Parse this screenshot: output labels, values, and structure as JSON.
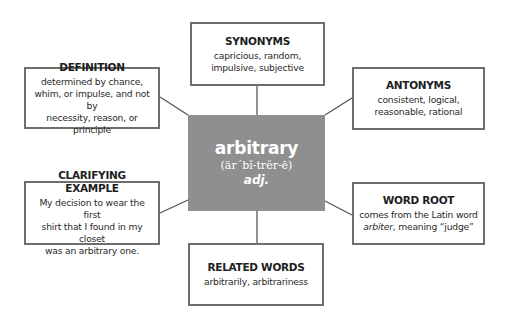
{
  "diagram": {
    "type": "vocabulary-word-map",
    "colors": {
      "center_fill": "#8f8f8f",
      "center_text": "#ffffff",
      "box_border": "#6e6e6e",
      "connector": "#555555",
      "text": "#222222"
    },
    "center": {
      "word": "arbitrary",
      "pronunciation": "(är´bĭ-trĕr-ē)",
      "part_of_speech": "adj."
    },
    "synonyms": {
      "title": "SYNONYMS",
      "line1": "capricious, random,",
      "line2": "impulsive, subjective"
    },
    "definition": {
      "title": "DEFINITION",
      "line1": "determined by chance,",
      "line2": "whim, or impulse, and not by",
      "line3": "necessity, reason, or principle"
    },
    "antonyms": {
      "title": "ANTONYMS",
      "line1": "consistent, logical,",
      "line2": "reasonable, rational"
    },
    "clarifying_example": {
      "title": "CLARIFYING EXAMPLE",
      "line1": "My decision to wear the first",
      "line2": "shirt that I found in my closet",
      "line3": "was an arbitrary one."
    },
    "word_root": {
      "title": "WORD ROOT",
      "line1": "comes from the Latin word",
      "line2_italic": "arbiter",
      "line2_rest": ", meaning “judge”"
    },
    "related_words": {
      "title": "RELATED WORDS",
      "line1": "arbitrarily, arbitrariness"
    }
  }
}
